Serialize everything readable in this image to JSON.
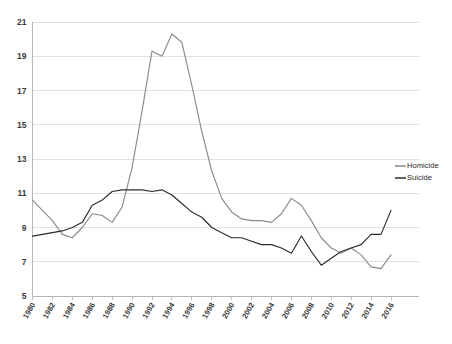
{
  "chart_data": {
    "type": "line",
    "title": "",
    "subtitle": "",
    "xlabel": "",
    "ylabel": "",
    "grid": true,
    "legend_position": "right",
    "ylim": [
      5,
      21
    ],
    "ytick_step": 2,
    "yticks": [
      "5",
      "7",
      "9",
      "11",
      "13",
      "15",
      "17",
      "19",
      "21"
    ],
    "xlim": [
      1980,
      2016
    ],
    "xtick_step": 2,
    "x": [
      1980,
      1981,
      1982,
      1983,
      1984,
      1985,
      1986,
      1987,
      1988,
      1989,
      1990,
      1991,
      1992,
      1993,
      1994,
      1995,
      1996,
      1997,
      1998,
      1999,
      2000,
      2001,
      2002,
      2003,
      2004,
      2005,
      2006,
      2007,
      2008,
      2009,
      2010,
      2011,
      2012,
      2013,
      2014,
      2015,
      2016
    ],
    "xticklabels": [
      "1980",
      "1982",
      "1984",
      "1986",
      "1988",
      "1990",
      "1992",
      "1994",
      "1996",
      "1998",
      "2000",
      "2002",
      "2004",
      "2006",
      "2008",
      "2010",
      "2012",
      "2014",
      "2016"
    ],
    "series": [
      {
        "name": "Homicide",
        "color": "#8a8a8a",
        "values": [
          10.6,
          10.0,
          9.4,
          8.6,
          8.4,
          9.0,
          9.8,
          9.7,
          9.3,
          10.2,
          12.5,
          15.8,
          19.3,
          19.0,
          20.3,
          19.8,
          17.3,
          14.6,
          12.3,
          10.7,
          9.9,
          9.5,
          9.4,
          9.4,
          9.3,
          9.8,
          10.7,
          10.3,
          9.4,
          8.4,
          7.8,
          7.5,
          7.8,
          7.4,
          6.7,
          6.6,
          7.4
        ]
      },
      {
        "name": "Suicide",
        "color": "#2b2b2b",
        "values": [
          8.5,
          8.6,
          8.7,
          8.8,
          9.0,
          9.3,
          10.3,
          10.6,
          11.1,
          11.2,
          11.2,
          11.2,
          11.1,
          11.2,
          10.9,
          10.4,
          9.9,
          9.6,
          9.0,
          8.7,
          8.4,
          8.4,
          8.2,
          8.0,
          8.0,
          7.8,
          7.5,
          8.5,
          7.6,
          6.8,
          7.2,
          7.6,
          7.8,
          8.0,
          8.6,
          8.6,
          10.0
        ]
      }
    ]
  },
  "legend": {
    "items": [
      {
        "label": "Homicide",
        "color": "#8a8a8a"
      },
      {
        "label": "Suicide",
        "color": "#2b2b2b"
      }
    ]
  }
}
